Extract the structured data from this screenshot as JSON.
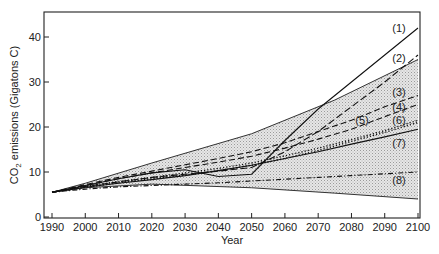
{
  "chart_data": {
    "type": "line",
    "title": "",
    "xlabel": "Year",
    "ylabel": "CO₂ emissions (Gigatons C)",
    "xlim": [
      1990,
      2100
    ],
    "ylim": [
      0,
      45
    ],
    "x_ticks": [
      1990,
      2000,
      2010,
      2020,
      2030,
      2040,
      2050,
      2060,
      2070,
      2080,
      2090,
      2100
    ],
    "y_ticks": [
      0,
      10,
      20,
      30,
      40
    ],
    "grid": false,
    "legend": "inline labels at right end of lines",
    "shaded_range": {
      "description": "Shaded band between upper and lower envelope",
      "upper": {
        "x": [
          1990,
          2000,
          2020,
          2050,
          2075,
          2100
        ],
        "y": [
          5.5,
          7.5,
          12,
          18.5,
          26,
          35
        ]
      },
      "lower": {
        "x": [
          1990,
          2000,
          2020,
          2050,
          2075,
          2100
        ],
        "y": [
          5.5,
          6.5,
          7.3,
          6.5,
          5.3,
          4
        ]
      }
    },
    "series": [
      {
        "name": "(1)",
        "style": "solid",
        "x": [
          1990,
          2000,
          2010,
          2020,
          2030,
          2040,
          2050,
          2060,
          2070,
          2080,
          2090,
          2100
        ],
        "y": [
          5.5,
          7,
          8.5,
          9.8,
          10.5,
          9,
          9.5,
          17,
          24,
          30,
          36,
          42
        ]
      },
      {
        "name": "(2)",
        "style": "longdash",
        "x": [
          1990,
          2000,
          2010,
          2020,
          2030,
          2040,
          2050,
          2060,
          2070,
          2080,
          2090,
          2100
        ],
        "y": [
          5.5,
          6.8,
          7.8,
          8.8,
          9.5,
          10.2,
          11,
          14.5,
          19,
          24.5,
          30,
          36
        ]
      },
      {
        "name": "(3)",
        "style": "dash",
        "x": [
          1990,
          2000,
          2010,
          2020,
          2030,
          2040,
          2050,
          2060,
          2070,
          2080,
          2090,
          2100
        ],
        "y": [
          5.5,
          7.2,
          8.8,
          10.2,
          11.6,
          13,
          14.5,
          16.5,
          19,
          21.5,
          24.5,
          27
        ]
      },
      {
        "name": "(4)",
        "style": "dash",
        "x": [
          1990,
          2000,
          2010,
          2020,
          2030,
          2040,
          2050,
          2060,
          2070,
          2080,
          2090,
          2100
        ],
        "y": [
          5.5,
          7,
          8.5,
          9.8,
          11,
          12.2,
          13.5,
          15.3,
          17.3,
          19.5,
          22.3,
          25
        ]
      },
      {
        "name": "(5)",
        "style": "dotted",
        "x": [
          1990,
          2000,
          2010,
          2020,
          2030,
          2040,
          2050,
          2060,
          2070,
          2080,
          2090,
          2100
        ],
        "y": [
          5.5,
          6.6,
          7.6,
          8.5,
          9.3,
          10.3,
          11.5,
          13,
          14.8,
          16.8,
          18.8,
          21
        ]
      },
      {
        "name": "(6)",
        "style": "dotted",
        "x": [
          1990,
          2000,
          2010,
          2020,
          2030,
          2040,
          2050,
          2060,
          2070,
          2080,
          2090,
          2100
        ],
        "y": [
          5.5,
          6.8,
          7.9,
          8.8,
          9.8,
          10.8,
          12,
          13.6,
          15.3,
          17.2,
          19.2,
          21.5
        ]
      },
      {
        "name": "(7)",
        "style": "solid",
        "x": [
          1990,
          2000,
          2010,
          2020,
          2030,
          2040,
          2050,
          2060,
          2070,
          2080,
          2090,
          2100
        ],
        "y": [
          5.5,
          6.6,
          7.5,
          8.3,
          9.2,
          10.3,
          11.5,
          13,
          14.5,
          16.2,
          17.8,
          19.5
        ]
      },
      {
        "name": "(8)",
        "style": "dashdot",
        "x": [
          1990,
          2000,
          2010,
          2020,
          2030,
          2040,
          2050,
          2060,
          2070,
          2080,
          2090,
          2100
        ],
        "y": [
          5.5,
          6.2,
          6.7,
          7,
          7.3,
          7.6,
          8,
          8.4,
          8.8,
          9.2,
          9.6,
          10
        ]
      }
    ]
  },
  "labels": {
    "xlabel": "Year",
    "ylabel_prefix": "CO",
    "ylabel_sub": "2",
    "ylabel_suffix": " emissions (Gigatons C)"
  }
}
